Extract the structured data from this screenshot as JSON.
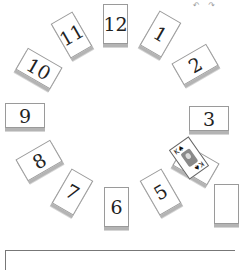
{
  "game": {
    "title": "Clock Solitaire",
    "top_icons": [
      "undo-icon",
      "redo-icon"
    ],
    "top_icons_text": "↶ ↷",
    "piles": [
      {
        "label": "12"
      },
      {
        "label": "1"
      },
      {
        "label": "2"
      },
      {
        "label": "3"
      },
      {
        "label": "4"
      },
      {
        "label": "5"
      },
      {
        "label": "6"
      },
      {
        "label": "7"
      },
      {
        "label": "8"
      },
      {
        "label": "9"
      },
      {
        "label": "10"
      },
      {
        "label": "11"
      }
    ],
    "face_up_card": {
      "rank": "K",
      "suit": "♠",
      "corner": "K♠"
    }
  },
  "colors": {
    "background": "#ffffff",
    "card_border": "#9a9a9a",
    "card_shadow": "#b4b4b4",
    "text": "#222222"
  }
}
